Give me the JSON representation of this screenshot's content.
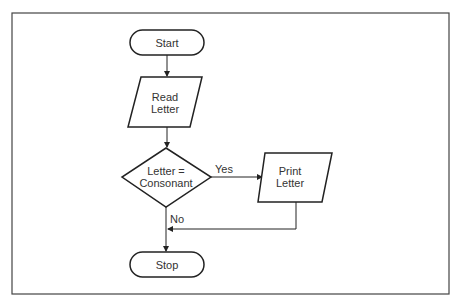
{
  "diagram": {
    "type": "flowchart",
    "nodes": [
      {
        "id": "start",
        "shape": "terminator",
        "label": "Start"
      },
      {
        "id": "read",
        "shape": "parallelogram",
        "label_lines": [
          "Read",
          "Letter"
        ]
      },
      {
        "id": "decision",
        "shape": "diamond",
        "label_lines": [
          "Letter =",
          "Consonant"
        ]
      },
      {
        "id": "print",
        "shape": "parallelogram",
        "label_lines": [
          "Print",
          "Letter"
        ]
      },
      {
        "id": "stop",
        "shape": "terminator",
        "label": "Stop"
      }
    ],
    "edges": [
      {
        "from": "start",
        "to": "read",
        "label": ""
      },
      {
        "from": "read",
        "to": "decision",
        "label": ""
      },
      {
        "from": "decision",
        "to": "print",
        "label": "Yes"
      },
      {
        "from": "decision",
        "to": "stop",
        "label": "No"
      },
      {
        "from": "print",
        "to": "stop",
        "label": ""
      }
    ],
    "labels": {
      "start": "Start",
      "read_1": "Read",
      "read_2": "Letter",
      "decision_1": "Letter =",
      "decision_2": "Consonant",
      "yes": "Yes",
      "no": "No",
      "print_1": "Print",
      "print_2": "Letter",
      "stop": "Stop"
    }
  }
}
